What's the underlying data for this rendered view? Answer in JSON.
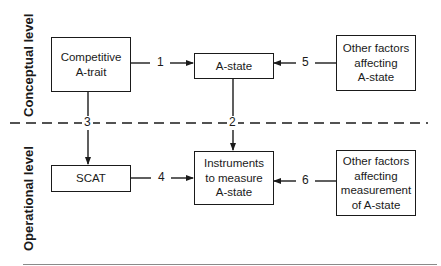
{
  "diagram": {
    "levels": {
      "conceptual": "Conceptual level",
      "operational": "Operational level"
    },
    "nodes": {
      "competitive_a_trait": [
        "Competitive",
        "A-trait"
      ],
      "a_state": [
        "A-state"
      ],
      "other_factors_a_state": [
        "Other factors",
        "affecting",
        "A-state"
      ],
      "scat": [
        "SCAT"
      ],
      "instruments": [
        "Instruments",
        "to measure",
        "A-state"
      ],
      "other_factors_measurement": [
        "Other factors",
        "affecting",
        "measurement",
        "of A-state"
      ]
    },
    "links": [
      {
        "label": "1",
        "from": "Competitive A-trait",
        "to": "A-state"
      },
      {
        "label": "2",
        "from": "A-state",
        "to": "Instruments to measure A-state"
      },
      {
        "label": "3",
        "from": "Competitive A-trait",
        "to": "SCAT"
      },
      {
        "label": "4",
        "from": "SCAT",
        "to": "Instruments to measure A-state"
      },
      {
        "label": "5",
        "from": "Other factors affecting A-state",
        "to": "A-state"
      },
      {
        "label": "6",
        "from": "Other factors affecting measurement of A-state",
        "to": "Instruments to measure A-state"
      }
    ],
    "colors": {
      "ink": "#1a1a1a",
      "rule": "#8a8a8a"
    }
  }
}
